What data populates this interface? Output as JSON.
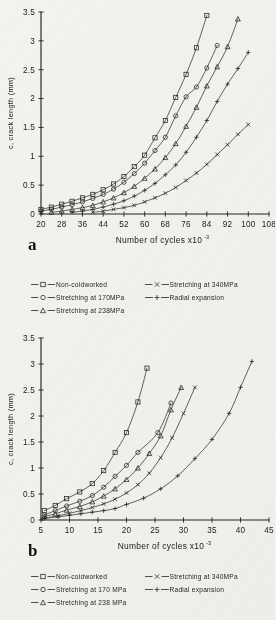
{
  "page": {
    "background_color": "#f4f2ef",
    "ink_color": "#23221f"
  },
  "figures": [
    {
      "panel_letter": "a",
      "legend_position": "below-plot",
      "chart_data": {
        "type": "line",
        "title": "",
        "subtitle": "",
        "xlabel": "Number of cycles x10",
        "xlabel_exponent": "-3",
        "ylabel": "c, crack length (mm)",
        "grid": false,
        "legend_position": "bottom",
        "xlim": [
          20,
          108
        ],
        "ylim": [
          0,
          3.5
        ],
        "xticks": [
          20,
          28,
          36,
          44,
          52,
          60,
          68,
          76,
          84,
          92,
          100,
          108
        ],
        "yticks": [
          0,
          0.5,
          1,
          1.5,
          2,
          2.5,
          3,
          3.5
        ],
        "series": [
          {
            "name": "Non-coldworked",
            "marker": "square",
            "x": [
              20,
              24,
              28,
              32,
              36,
              40,
              44,
              48,
              52,
              56,
              60,
              64,
              68,
              72,
              76,
              80,
              84
            ],
            "y": [
              0.08,
              0.12,
              0.17,
              0.22,
              0.28,
              0.34,
              0.42,
              0.52,
              0.65,
              0.82,
              1.02,
              1.32,
              1.62,
              2.02,
              2.42,
              2.88,
              3.44
            ]
          },
          {
            "name": "Stretching at 170MPa",
            "marker": "circle",
            "x": [
              20,
              24,
              28,
              32,
              36,
              40,
              44,
              48,
              52,
              56,
              60,
              64,
              68,
              72,
              76,
              80,
              84,
              88
            ],
            "y": [
              0.05,
              0.08,
              0.12,
              0.16,
              0.21,
              0.27,
              0.34,
              0.43,
              0.55,
              0.7,
              0.88,
              1.1,
              1.33,
              1.7,
              2.03,
              2.2,
              2.53,
              2.92
            ]
          },
          {
            "name": "Stretching at 238MPa",
            "marker": "triangle",
            "x": [
              24,
              28,
              32,
              36,
              40,
              44,
              48,
              52,
              56,
              60,
              64,
              68,
              72,
              76,
              80,
              84,
              88,
              92,
              96
            ],
            "y": [
              0.03,
              0.05,
              0.08,
              0.11,
              0.15,
              0.21,
              0.28,
              0.37,
              0.48,
              0.62,
              0.78,
              0.98,
              1.22,
              1.52,
              1.85,
              2.22,
              2.55,
              2.9,
              3.38
            ]
          },
          {
            "name": "Radial expansion",
            "marker": "plus",
            "x": [
              32,
              36,
              40,
              44,
              48,
              52,
              56,
              60,
              64,
              68,
              72,
              76,
              80,
              84,
              88,
              92,
              96,
              100
            ],
            "y": [
              0.03,
              0.05,
              0.08,
              0.12,
              0.17,
              0.23,
              0.31,
              0.41,
              0.53,
              0.68,
              0.85,
              1.07,
              1.33,
              1.62,
              1.95,
              2.25,
              2.52,
              2.8
            ]
          },
          {
            "name": "Stretching at 340MPa",
            "marker": "cross",
            "x": [
              40,
              44,
              48,
              52,
              56,
              60,
              64,
              68,
              72,
              76,
              80,
              84,
              88,
              92,
              96,
              100
            ],
            "y": [
              0.03,
              0.05,
              0.08,
              0.11,
              0.15,
              0.21,
              0.28,
              0.36,
              0.46,
              0.58,
              0.71,
              0.86,
              1.03,
              1.2,
              1.38,
              1.55
            ]
          }
        ]
      },
      "legend": [
        {
          "label": "Non-coldworked",
          "marker": "square"
        },
        {
          "label": "Stretching at 170MPa",
          "marker": "circle"
        },
        {
          "label": "Stretching at 238MPa",
          "marker": "triangle"
        },
        {
          "label": "Stretching at 340MPa",
          "marker": "cross"
        },
        {
          "label": "Radial expansion",
          "marker": "plus"
        }
      ]
    },
    {
      "panel_letter": "b",
      "legend_position": "below-plot",
      "chart_data": {
        "type": "line",
        "title": "",
        "subtitle": "",
        "xlabel": "Number of cycles x10",
        "xlabel_exponent": "-3",
        "ylabel": "c, crack length (mm)",
        "grid": false,
        "legend_position": "bottom",
        "xlim": [
          5,
          45
        ],
        "ylim": [
          0,
          3.5
        ],
        "xticks": [
          5,
          10,
          15,
          20,
          25,
          30,
          35,
          40,
          45
        ],
        "yticks": [
          0,
          0.5,
          1,
          1.5,
          2,
          2.5,
          3,
          3.5
        ],
        "series": [
          {
            "name": "Non-coldworked",
            "marker": "square",
            "x": [
              5.6,
              7.5,
              9.5,
              11.8,
              14,
              16,
              18,
              20,
              22,
              23.6
            ],
            "y": [
              0.18,
              0.28,
              0.41,
              0.54,
              0.7,
              0.95,
              1.3,
              1.68,
              2.27,
              2.92
            ]
          },
          {
            "name": "Stretching at 170MPa",
            "marker": "circle",
            "x": [
              5.6,
              7.5,
              9.5,
              11.8,
              14,
              16,
              18,
              20,
              22,
              25.5,
              27.8
            ],
            "y": [
              0.1,
              0.18,
              0.27,
              0.36,
              0.47,
              0.63,
              0.84,
              1.05,
              1.3,
              1.68,
              2.25
            ]
          },
          {
            "name": "Stretching at 238MPa",
            "marker": "triangle",
            "x": [
              5.6,
              7.5,
              9.5,
              11.8,
              14,
              16,
              18,
              20,
              22,
              24,
              26,
              27.8,
              29.6
            ],
            "y": [
              0.07,
              0.12,
              0.19,
              0.26,
              0.35,
              0.46,
              0.6,
              0.78,
              1.0,
              1.28,
              1.62,
              2.12,
              2.55
            ]
          },
          {
            "name": "Stretching at 340MPa",
            "marker": "cross",
            "x": [
              5.6,
              8,
              10,
              12,
              14,
              16,
              18,
              20,
              22,
              24,
              26,
              28,
              30,
              32
            ],
            "y": [
              0.04,
              0.08,
              0.13,
              0.18,
              0.24,
              0.31,
              0.4,
              0.52,
              0.68,
              0.9,
              1.2,
              1.58,
              2.05,
              2.55
            ]
          },
          {
            "name": "Radial expansion",
            "marker": "plus",
            "x": [
              5.6,
              8,
              10,
              12,
              14,
              16,
              18,
              20,
              23,
              26,
              29,
              32,
              35,
              38,
              40,
              42
            ],
            "y": [
              0.03,
              0.06,
              0.09,
              0.12,
              0.15,
              0.18,
              0.22,
              0.3,
              0.42,
              0.6,
              0.85,
              1.18,
              1.55,
              2.05,
              2.55,
              3.05
            ]
          }
        ]
      },
      "legend": [
        {
          "label": "Non-coldworked",
          "marker": "square"
        },
        {
          "label": "Stretching at 170 MPa",
          "marker": "circle"
        },
        {
          "label": "Stretching at  238 MPa",
          "marker": "triangle"
        },
        {
          "label": "Stretching at 340MPa",
          "marker": "cross"
        },
        {
          "label": "Radial expansion",
          "marker": "plus"
        }
      ]
    }
  ]
}
